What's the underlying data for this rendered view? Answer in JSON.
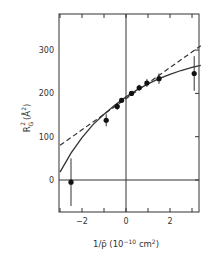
{
  "chart_data": {
    "type": "scatter",
    "title": "",
    "xlabel": "1/p̄ (10⁻¹⁰ cm²)",
    "ylabel": "R²G (Å²)",
    "xlim": [
      -3,
      3.4
    ],
    "ylim": [
      -80,
      380
    ],
    "x_ticks": [
      -2,
      0,
      2
    ],
    "x_minor_ticks": [
      -3,
      -2,
      -1,
      0,
      1,
      2,
      3
    ],
    "y_ticks": [
      0,
      100,
      200,
      300
    ],
    "grid": false,
    "reference_lines": {
      "x0": true,
      "y0": true
    },
    "series": [
      {
        "name": "data",
        "kind": "points_with_error_bars",
        "points": [
          {
            "x": -2.5,
            "y": -5,
            "err": 55
          },
          {
            "x": -0.9,
            "y": 138,
            "err": 14
          },
          {
            "x": -0.4,
            "y": 170,
            "err": 8
          },
          {
            "x": -0.2,
            "y": 184,
            "err": 4
          },
          {
            "x": 0.25,
            "y": 200,
            "err": 3
          },
          {
            "x": 0.6,
            "y": 213,
            "err": 7
          },
          {
            "x": 0.95,
            "y": 224,
            "err": 9
          },
          {
            "x": 1.5,
            "y": 234,
            "err": 12
          },
          {
            "x": 3.1,
            "y": 246,
            "err": 40
          }
        ]
      },
      {
        "name": "linear fit",
        "kind": "dashed_line",
        "x": [
          -3,
          3.4
        ],
        "y": [
          80,
          310
        ]
      },
      {
        "name": "curve fit",
        "kind": "solid_curve",
        "x": [
          -3,
          -2.5,
          -2,
          -1.5,
          -1,
          -0.5,
          0,
          0.5,
          1,
          1.5,
          2,
          2.5,
          3,
          3.4
        ],
        "y": [
          18,
          62,
          98,
          128,
          152,
          173,
          192,
          208,
          222,
          234,
          244,
          253,
          260,
          265
        ]
      }
    ]
  },
  "labels": {
    "x_axis": {
      "main": "1/p̄",
      "unit_open": " (10",
      "exp": "−10",
      "unit_mid": " cm",
      "exp2": "2",
      "unit_close": ")"
    },
    "y_axis": "R²G (Å²)",
    "x_tick_labels": [
      "−2",
      "0",
      "2"
    ],
    "y_tick_labels": [
      "0",
      "100",
      "200",
      "300"
    ]
  }
}
